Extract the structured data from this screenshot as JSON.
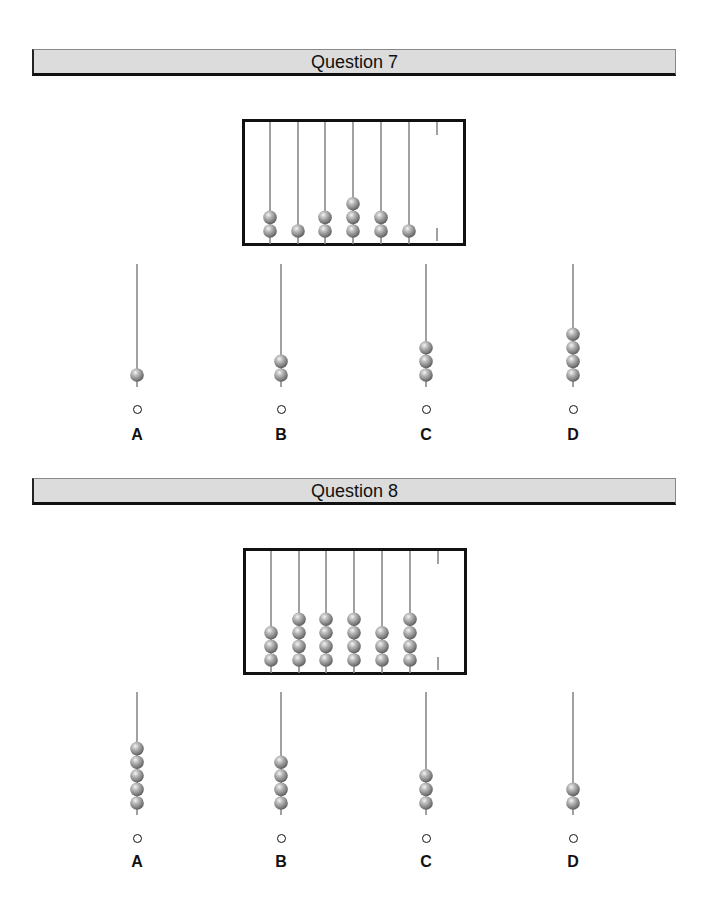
{
  "questions": [
    {
      "title": "Question 7",
      "abacus": {
        "rod_bead_counts": [
          2,
          1,
          2,
          3,
          2,
          1,
          0
        ]
      },
      "options": [
        {
          "label": "A",
          "beads": 1,
          "selected": false
        },
        {
          "label": "B",
          "beads": 2,
          "selected": false
        },
        {
          "label": "C",
          "beads": 3,
          "selected": false
        },
        {
          "label": "D",
          "beads": 4,
          "selected": false
        }
      ]
    },
    {
      "title": "Question 8",
      "abacus": {
        "rod_bead_counts": [
          3,
          4,
          4,
          4,
          3,
          4,
          0
        ]
      },
      "options": [
        {
          "label": "A",
          "beads": 5,
          "selected": false
        },
        {
          "label": "B",
          "beads": 4,
          "selected": false
        },
        {
          "label": "C",
          "beads": 3,
          "selected": false
        },
        {
          "label": "D",
          "beads": 2,
          "selected": false
        }
      ]
    }
  ],
  "colors": {
    "header_bg": "#dcdcdc",
    "rod": "#8a8a8a",
    "bead": "#9a9a9a",
    "frame": "#111111"
  }
}
